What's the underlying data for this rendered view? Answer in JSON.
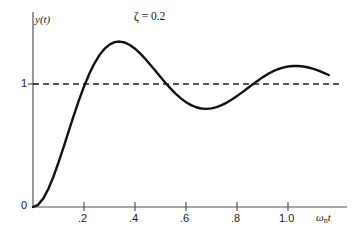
{
  "figure": {
    "background_color": "#ffffff",
    "line_color": "#111111",
    "dashed_color": "#222222",
    "axis_color": "#555555"
  },
  "axes": {
    "y_axis_title": "y(t)",
    "x_axis_title_symbol": "ω",
    "x_axis_title_subscript": "n",
    "x_axis_title_variable": "t",
    "origin_label": "0",
    "y_tick_label_1": "1"
  },
  "annotation": {
    "damping_label": "ζ = 0.2"
  },
  "chart_data": {
    "type": "line",
    "title": "",
    "subtitle": "",
    "xlabel": "ωₙt",
    "ylabel": "y(t)",
    "xlim": [
      0,
      1.22
    ],
    "ylim": [
      0,
      1.62
    ],
    "grid": false,
    "legend": null,
    "annotations": [
      {
        "text": "ζ = 0.2",
        "x": 0.42,
        "y": 1.53,
        "meaning": "damping ratio zeta equals 0.2"
      }
    ],
    "xticks": [
      0.2,
      0.4,
      0.6,
      0.8,
      1.0
    ],
    "xtick_labels": [
      ".2",
      ".4",
      ".6",
      ".8",
      "1.0"
    ],
    "yticks": [
      0,
      1
    ],
    "ytick_labels": [
      "0",
      "1"
    ],
    "reference_lines": [
      {
        "name": "steady-state",
        "orientation": "horizontal",
        "y": 1,
        "style": "dashed"
      }
    ],
    "series": [
      {
        "name": "step response, zeta = 0.2",
        "x": [
          0.0,
          0.02,
          0.04,
          0.06,
          0.08,
          0.1,
          0.12,
          0.14,
          0.16,
          0.18,
          0.2,
          0.22,
          0.24,
          0.26,
          0.28,
          0.3,
          0.32,
          0.34,
          0.36,
          0.38,
          0.4,
          0.42,
          0.44,
          0.46,
          0.48,
          0.5,
          0.52,
          0.54,
          0.56,
          0.58,
          0.6,
          0.62,
          0.64,
          0.66,
          0.68,
          0.7,
          0.72,
          0.74,
          0.76,
          0.78,
          0.8,
          0.82,
          0.84,
          0.86,
          0.88,
          0.9,
          0.92,
          0.94,
          0.96,
          0.98,
          1.0,
          1.02,
          1.04,
          1.06,
          1.08,
          1.1,
          1.12,
          1.14,
          1.16
        ],
        "y": [
          0.0,
          0.018,
          0.068,
          0.146,
          0.246,
          0.362,
          0.487,
          0.617,
          0.745,
          0.867,
          0.98,
          1.079,
          1.164,
          1.233,
          1.285,
          1.32,
          1.34,
          1.345,
          1.337,
          1.317,
          1.287,
          1.249,
          1.205,
          1.157,
          1.107,
          1.057,
          1.008,
          0.962,
          0.92,
          0.883,
          0.852,
          0.828,
          0.811,
          0.801,
          0.798,
          0.802,
          0.812,
          0.828,
          0.849,
          0.874,
          0.902,
          0.932,
          0.963,
          0.995,
          1.025,
          1.054,
          1.08,
          1.102,
          1.12,
          1.133,
          1.142,
          1.146,
          1.146,
          1.142,
          1.134,
          1.123,
          1.108,
          1.091,
          1.073
        ]
      }
    ],
    "features": {
      "first_peak": {
        "x": 0.34,
        "y": 1.345
      },
      "first_trough": {
        "x": 0.67,
        "y": 0.798
      },
      "second_peak": {
        "x": 1.02,
        "y": 1.146
      },
      "crossings_of_unity": [
        0.205,
        0.52,
        0.87
      ],
      "final_value": 1.073
    }
  }
}
